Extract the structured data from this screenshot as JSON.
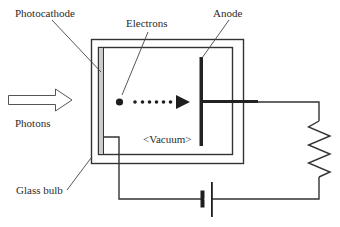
{
  "diagram": {
    "labels": {
      "photocathode": "Photocathode",
      "electrons": "Electrons",
      "anode": "Anode",
      "photons": "Photons",
      "vacuum": "<Vacuum>",
      "glass_bulb": "Glass bulb"
    },
    "components": [
      "glass-bulb",
      "photocathode",
      "anode",
      "electron-path",
      "photon-arrow",
      "resistor",
      "battery",
      "circuit-wire"
    ],
    "colors": {
      "line": "#333333",
      "photocathode_fill": "#cccccc",
      "background": "#ffffff"
    }
  }
}
